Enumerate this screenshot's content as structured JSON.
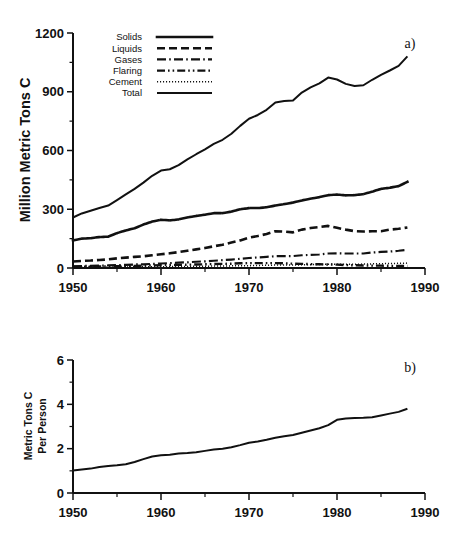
{
  "figure": {
    "panel_a_tag": "a)",
    "panel_b_tag": "b)"
  },
  "panel_a": {
    "ylabel": "Million Metric Tons C",
    "y_ticks": [
      "0",
      "300",
      "600",
      "900",
      "1200"
    ],
    "x_ticks": [
      "1950",
      "1960",
      "1970",
      "1980",
      "1990"
    ],
    "legend": [
      {
        "label": "Solids",
        "style": "dotted-square"
      },
      {
        "label": "Liquids",
        "style": "dashed-long"
      },
      {
        "label": "Gases",
        "style": "dash-dot"
      },
      {
        "label": "Flaring",
        "style": "dash-dot-dot"
      },
      {
        "label": "Cement",
        "style": "dotted-fine"
      },
      {
        "label": "Total",
        "style": "solid"
      }
    ]
  },
  "panel_b": {
    "ylabel_line1": "Metric Tons C",
    "ylabel_line2": "Per Person",
    "y_ticks": [
      "0",
      "2",
      "4",
      "6"
    ],
    "x_ticks": [
      "1950",
      "1960",
      "1970",
      "1980",
      "1990"
    ]
  },
  "chart_data": [
    {
      "type": "line",
      "panel": "a",
      "title": "",
      "xlabel": "",
      "ylabel": "Million Metric Tons C",
      "xlim": [
        1950,
        1990
      ],
      "ylim": [
        0,
        1200
      ],
      "x_ticks": [
        1950,
        1960,
        1970,
        1980,
        1990
      ],
      "y_ticks": [
        0,
        300,
        600,
        900,
        1200
      ],
      "x_minor_ticks": [
        1955,
        1965,
        1975,
        1985
      ],
      "y_minor_ticks": [
        150,
        450,
        750,
        1050
      ],
      "grid": false,
      "legend_position": "top-left",
      "x": [
        1950,
        1951,
        1952,
        1953,
        1954,
        1955,
        1956,
        1957,
        1958,
        1959,
        1960,
        1961,
        1962,
        1963,
        1964,
        1965,
        1966,
        1967,
        1968,
        1969,
        1970,
        1971,
        1972,
        1973,
        1974,
        1975,
        1976,
        1977,
        1978,
        1979,
        1980,
        1981,
        1982,
        1983,
        1984,
        1985,
        1986,
        1987,
        1988
      ],
      "series": [
        {
          "name": "Solids",
          "style": "dotted-square",
          "values": [
            141,
            150,
            152,
            158,
            160,
            178,
            192,
            203,
            222,
            237,
            246,
            243,
            248,
            258,
            266,
            272,
            280,
            280,
            288,
            300,
            306,
            306,
            310,
            319,
            326,
            334,
            345,
            354,
            362,
            372,
            375,
            371,
            372,
            377,
            390,
            404,
            410,
            418,
            440
          ]
        },
        {
          "name": "Liquids",
          "style": "dashed-long",
          "values": [
            33,
            36,
            38,
            41,
            44,
            49,
            53,
            57,
            60,
            65,
            70,
            75,
            81,
            88,
            95,
            102,
            111,
            119,
            130,
            141,
            155,
            163,
            174,
            188,
            186,
            182,
            196,
            204,
            209,
            215,
            205,
            196,
            188,
            186,
            188,
            188,
            196,
            200,
            207
          ]
        },
        {
          "name": "Gases",
          "style": "dash-dot",
          "values": [
            9,
            10,
            11,
            12,
            13,
            15,
            16,
            18,
            19,
            21,
            23,
            25,
            27,
            29,
            32,
            34,
            37,
            40,
            43,
            47,
            51,
            54,
            57,
            60,
            61,
            61,
            65,
            67,
            69,
            74,
            75,
            74,
            74,
            74,
            79,
            82,
            84,
            88,
            93
          ]
        },
        {
          "name": "Flaring",
          "style": "dash-dot-dot",
          "values": [
            6,
            7,
            7,
            8,
            8,
            9,
            10,
            11,
            12,
            13,
            14,
            15,
            16,
            17,
            18,
            19,
            20,
            21,
            22,
            24,
            25,
            25,
            25,
            25,
            24,
            22,
            21,
            20,
            19,
            18,
            17,
            15,
            14,
            13,
            12,
            12,
            11,
            11,
            11
          ]
        },
        {
          "name": "Cement",
          "style": "dotted-fine",
          "values": [
            3,
            3,
            4,
            4,
            4,
            5,
            5,
            6,
            6,
            7,
            7,
            7,
            8,
            8,
            9,
            9,
            10,
            10,
            11,
            12,
            12,
            13,
            14,
            15,
            15,
            15,
            16,
            17,
            18,
            19,
            19,
            19,
            19,
            20,
            21,
            22,
            23,
            24,
            25
          ]
        },
        {
          "name": "Total",
          "style": "solid",
          "values": [
            185,
            200,
            210,
            220,
            229,
            249,
            270,
            290,
            313,
            338,
            357,
            362,
            377,
            398,
            417,
            435,
            455,
            470,
            492,
            521,
            547,
            561,
            580,
            607,
            612,
            614,
            643,
            662,
            677,
            698,
            691,
            675,
            667,
            670,
            690,
            708,
            724,
            741,
            776
          ]
        }
      ],
      "note": "Total as drawn rises from about 185 in 1950 to about 1080 in 1988 on the printed axis"
    },
    {
      "type": "line",
      "panel": "b",
      "title": "",
      "xlabel": "",
      "ylabel": "Metric Tons C Per Person",
      "xlim": [
        1950,
        1990
      ],
      "ylim": [
        0,
        6
      ],
      "x_ticks": [
        1950,
        1960,
        1970,
        1980,
        1990
      ],
      "y_ticks": [
        0,
        2,
        4,
        6
      ],
      "x_minor_ticks": [
        1955,
        1965,
        1975,
        1985
      ],
      "y_minor_ticks": [
        1,
        3,
        5
      ],
      "grid": false,
      "legend_position": "none",
      "x": [
        1950,
        1951,
        1952,
        1953,
        1954,
        1955,
        1956,
        1957,
        1958,
        1959,
        1960,
        1961,
        1962,
        1963,
        1964,
        1965,
        1966,
        1967,
        1968,
        1969,
        1970,
        1971,
        1972,
        1973,
        1974,
        1975,
        1976,
        1977,
        1978,
        1979,
        1980,
        1981,
        1982,
        1983,
        1984,
        1985,
        1986,
        1987,
        1988
      ],
      "series": [
        {
          "name": "Per capita emissions",
          "style": "solid",
          "values": [
            1.02,
            1.06,
            1.1,
            1.17,
            1.22,
            1.25,
            1.3,
            1.4,
            1.53,
            1.65,
            1.7,
            1.73,
            1.78,
            1.8,
            1.84,
            1.9,
            1.96,
            2.0,
            2.06,
            2.16,
            2.27,
            2.32,
            2.4,
            2.49,
            2.56,
            2.62,
            2.72,
            2.82,
            2.92,
            3.06,
            3.3,
            3.36,
            3.38,
            3.39,
            3.42,
            3.5,
            3.58,
            3.66,
            3.8
          ]
        }
      ]
    }
  ]
}
